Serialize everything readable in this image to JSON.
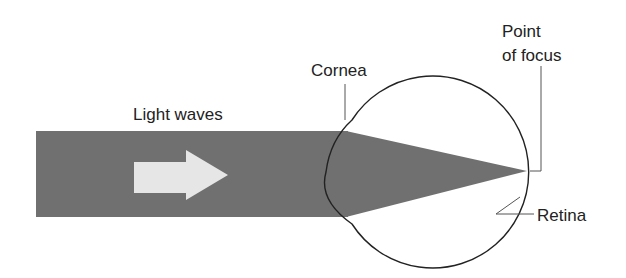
{
  "diagram": {
    "labels": {
      "light_waves": "Light waves",
      "cornea": "Cornea",
      "point_of_focus_line1": "Point",
      "point_of_focus_line2": "of focus",
      "retina": "Retina"
    },
    "colors": {
      "beam": "#707070",
      "arrow": "#e6e6e6",
      "outline": "#222222",
      "leader": "#555555",
      "background": "#ffffff"
    }
  }
}
